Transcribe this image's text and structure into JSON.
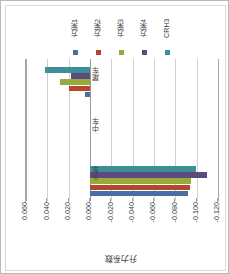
{
  "chart_data": {
    "type": "bar",
    "orientation": "horizontal",
    "title": "",
    "xlabel": "升力系数",
    "ylabel": "",
    "categories": [
      "尾车",
      "中车",
      "头车"
    ],
    "legend_position": "top",
    "grid": true,
    "axis_reversed": true,
    "xlim": [
      0.06,
      -0.12
    ],
    "ticks": [
      "0.060",
      "0.040",
      "0.020",
      "0.000",
      "-0.020",
      "-0.040",
      "-0.060",
      "-0.080",
      "-0.100",
      "-0.120"
    ],
    "tick_values": [
      0.06,
      0.04,
      0.02,
      0.0,
      -0.02,
      -0.04,
      -0.06,
      -0.08,
      -0.1,
      -0.12
    ],
    "series": [
      {
        "name": "方案1",
        "color": "#4a6fa5",
        "values": [
          0.005,
          0.0,
          -0.092
        ]
      },
      {
        "name": "方案2",
        "color": "#b4472c",
        "values": [
          0.02,
          0.0,
          -0.094
        ]
      },
      {
        "name": "方案3",
        "color": "#9aaa3a",
        "values": [
          0.028,
          0.0,
          -0.095
        ]
      },
      {
        "name": "方案4",
        "color": "#5f4a80",
        "values": [
          0.018,
          0.0,
          -0.11
        ]
      },
      {
        "name": "CRH3",
        "color": "#3f8f96",
        "values": [
          0.042,
          0.0,
          -0.099
        ]
      }
    ]
  },
  "legend": {
    "items": [
      {
        "label": "方案1",
        "color": "#4a6fa5"
      },
      {
        "label": "方案2",
        "color": "#b4472c"
      },
      {
        "label": "方案3",
        "color": "#9aaa3a"
      },
      {
        "label": "方案4",
        "color": "#5f4a80"
      },
      {
        "label": "CRH3",
        "color": "#3f8f96"
      }
    ]
  },
  "axis": {
    "title": "升力系数"
  }
}
